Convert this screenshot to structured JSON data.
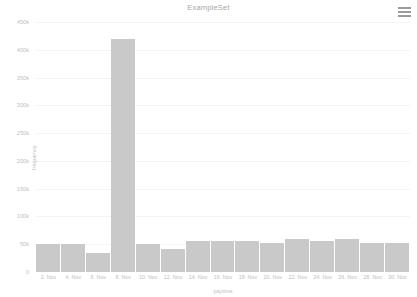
{
  "header": {
    "title": "ExampleSet",
    "menu_icon": "hamburger-menu-icon"
  },
  "colors": {
    "bar": "#c9c9c9",
    "grid": "#f4f4f4",
    "text": "#c0c0c0",
    "title_text": "#a8a8a8",
    "background": "#ffffff"
  },
  "chart_data": {
    "type": "bar",
    "title": "ExampleSet",
    "xlabel": "paytime",
    "ylabel": "frequency",
    "ylim": [
      0,
      450000
    ],
    "grid": true,
    "legend": "none",
    "ytick_labels": [
      "450k",
      "400k",
      "350k",
      "300k",
      "250k",
      "200k",
      "150k",
      "100k",
      "50k",
      "0"
    ],
    "ytick_values": [
      450000,
      400000,
      350000,
      300000,
      250000,
      200000,
      150000,
      100000,
      50000,
      0
    ],
    "xtick_labels": [
      "2. Nov",
      "4. Nov",
      "6. Nov",
      "8. Nov",
      "10. Nov",
      "12. Nov",
      "14. Nov",
      "16. Nov",
      "18. Nov",
      "20. Nov",
      "22. Nov",
      "24. Nov",
      "26. Nov",
      "28. Nov",
      "30. Nov"
    ],
    "categories": [
      "2. Nov",
      "4. Nov",
      "6. Nov",
      "8. Nov",
      "10. Nov",
      "12. Nov",
      "14. Nov",
      "16. Nov",
      "18. Nov",
      "20. Nov",
      "22. Nov",
      "24. Nov",
      "26. Nov",
      "28. Nov",
      "30. Nov"
    ],
    "values": [
      50000,
      50000,
      34000,
      420000,
      50000,
      42000,
      55000,
      55000,
      55000,
      52000,
      60000,
      55000,
      60000,
      52000,
      52000
    ]
  }
}
